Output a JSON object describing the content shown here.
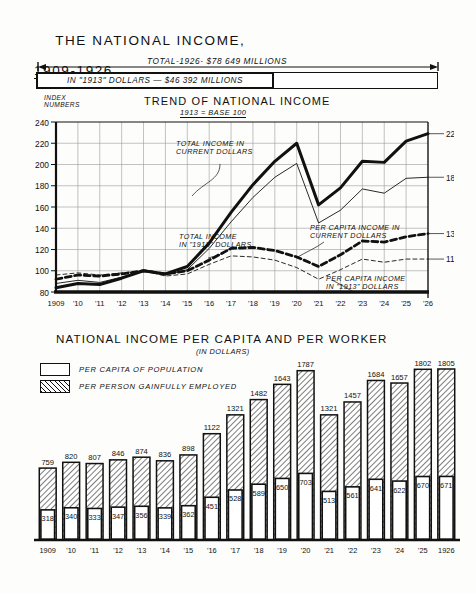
{
  "title": {
    "line1": "THE NATIONAL INCOME,",
    "line2": "1909-1926"
  },
  "total_bars": {
    "total_label": "TOTAL-1926- $78 649 MILLIONS",
    "deflated_label": "IN \"1913\" DOLLARS — $46 392 MILLIONS"
  },
  "line_chart": {
    "title": "TREND OF NATIONAL INCOME",
    "subtitle": "1913 = BASE 100",
    "axis_label": "INDEX\nNUMBERS",
    "annotations": {
      "total_current": "TOTAL INCOME IN\nCURRENT DOLLARS",
      "total_1913": "TOTAL INCOME\nIN \"1913\" DOLLARS",
      "percap_current": "PER CAPITA INCOME IN\nCURRENT DOLLARS",
      "percap_1913": "PER CAPITA INCOME\nIN \"1913\" DOLLARS"
    },
    "end_labels": {
      "total_current": "229",
      "percap_current": "188",
      "total_1913": "135",
      "percap_1913": "111"
    }
  },
  "bar_chart": {
    "title": "NATIONAL INCOME PER CAPITA AND PER WORKER",
    "subtitle": "(IN DOLLARS)",
    "legend": [
      {
        "label": "PER CAPITA OF POPULATION",
        "swatch": "plain"
      },
      {
        "label": "PER PERSON GAINFULLY EMPLOYED",
        "swatch": "hatched"
      }
    ]
  },
  "chart_data": [
    {
      "type": "line",
      "title": "TREND OF NATIONAL INCOME",
      "subtitle": "1913 = BASE 100",
      "xlabel": "",
      "ylabel": "INDEX NUMBERS",
      "ylim": [
        80,
        240
      ],
      "yticks": [
        80,
        100,
        120,
        140,
        160,
        180,
        200,
        220,
        240
      ],
      "grid": true,
      "legend_position": "inline-annotations",
      "x": [
        1909,
        1910,
        1911,
        1912,
        1913,
        1914,
        1915,
        1916,
        1917,
        1918,
        1919,
        1920,
        1921,
        1922,
        1923,
        1924,
        1925,
        1926
      ],
      "tick_labels": [
        "1909",
        "'10",
        "'11",
        "'12",
        "'13",
        "'14",
        "'15",
        "'16",
        "'17",
        "'18",
        "'19",
        "'20",
        "'21",
        "'22",
        "'23",
        "'24",
        "'25",
        "'26"
      ],
      "series": [
        {
          "name": "TOTAL INCOME IN CURRENT DOLLARS",
          "style": "thick-solid",
          "end_label": "229",
          "values": [
            84,
            88,
            87,
            93,
            100,
            97,
            104,
            126,
            155,
            181,
            203,
            220,
            162,
            178,
            203,
            202,
            222,
            229
          ]
        },
        {
          "name": "PER CAPITA INCOME IN CURRENT DOLLARS",
          "style": "thin-solid",
          "end_label": "188",
          "values": [
            88,
            91,
            89,
            94,
            100,
            96,
            101,
            121,
            146,
            169,
            188,
            201,
            145,
            157,
            177,
            173,
            187,
            188
          ]
        },
        {
          "name": "TOTAL INCOME IN \"1913\" DOLLARS",
          "style": "thick-dashed",
          "end_label": "135",
          "values": [
            92,
            96,
            95,
            97,
            100,
            97,
            100,
            110,
            121,
            122,
            119,
            113,
            104,
            115,
            128,
            127,
            132,
            135
          ]
        },
        {
          "name": "PER CAPITA INCOME IN \"1913\" DOLLARS",
          "style": "thin-dashed",
          "end_label": "111",
          "values": [
            96,
            98,
            96,
            98,
            100,
            95,
            97,
            106,
            114,
            113,
            110,
            103,
            92,
            101,
            111,
            108,
            111,
            111
          ]
        }
      ]
    },
    {
      "type": "bar",
      "title": "NATIONAL INCOME PER CAPITA AND PER WORKER",
      "subtitle": "(IN DOLLARS)",
      "xlabel": "",
      "ylabel": "",
      "ylim": [
        0,
        1900
      ],
      "grid": false,
      "legend_position": "top-left",
      "categories": [
        "1909",
        "'10",
        "'11",
        "'12",
        "'13",
        "'14",
        "'15",
        "'16",
        "'17",
        "'18",
        "'19",
        "'20",
        "'21",
        "'22",
        "'23",
        "'24",
        "'25",
        "1926"
      ],
      "series": [
        {
          "name": "PER PERSON GAINFULLY EMPLOYED",
          "style": "hatched",
          "values": [
            759,
            820,
            807,
            846,
            874,
            836,
            898,
            1122,
            1321,
            1482,
            1643,
            1787,
            1321,
            1457,
            1684,
            1657,
            1802,
            1805
          ]
        },
        {
          "name": "PER CAPITA OF POPULATION",
          "style": "plain",
          "values": [
            318,
            340,
            333,
            347,
            356,
            339,
            362,
            451,
            528,
            589,
            650,
            703,
            513,
            561,
            641,
            622,
            670,
            671
          ]
        }
      ]
    }
  ]
}
